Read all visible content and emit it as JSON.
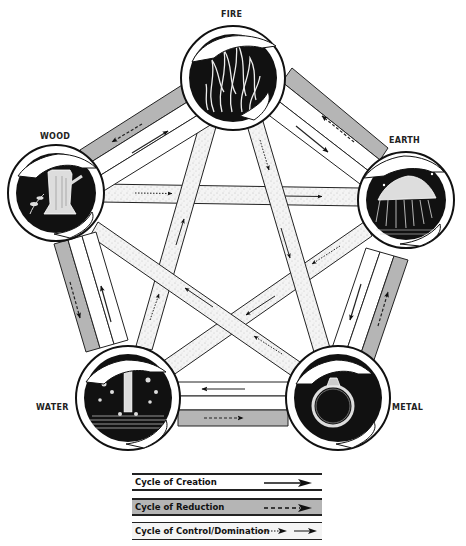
{
  "diagram": {
    "title": "",
    "elements": [
      {
        "id": "fire",
        "label": "FIRE",
        "cx": 233,
        "cy": 78,
        "r": 52,
        "depiction": "flames"
      },
      {
        "id": "earth",
        "label": "EARTH",
        "cx": 406,
        "cy": 200,
        "r": 48,
        "depiction": "mountain-landscape"
      },
      {
        "id": "metal",
        "label": "METAL",
        "cx": 338,
        "cy": 398,
        "r": 52,
        "depiction": "ring"
      },
      {
        "id": "water",
        "label": "WATER",
        "cx": 128,
        "cy": 398,
        "r": 52,
        "depiction": "waterfall"
      },
      {
        "id": "wood",
        "label": "WOOD",
        "cx": 56,
        "cy": 193,
        "r": 48,
        "depiction": "tree-stump"
      }
    ],
    "cycles": {
      "creation": [
        "wood",
        "fire",
        "earth",
        "metal",
        "water",
        "wood"
      ],
      "reduction": [
        "wood",
        "water",
        "metal",
        "earth",
        "fire",
        "wood"
      ],
      "control": [
        "wood",
        "earth",
        "water",
        "fire",
        "metal",
        "wood"
      ]
    }
  },
  "legend": {
    "items": [
      {
        "label": "Cycle of Creation",
        "style": "solid-arrow",
        "band_color": "#ffffff"
      },
      {
        "label": "Cycle of Reduction",
        "style": "dashed-arrow",
        "band_color": "#b8b8b8"
      },
      {
        "label": "Cycle of Control/Domination",
        "style": "dotted-and-solid-arrow",
        "band_color": "#f2f2f2"
      }
    ]
  },
  "colors": {
    "line": "#222222",
    "reduction_band": "#b5b5b5",
    "control_band": "#f1f1f1",
    "circle_fill": "#111111"
  }
}
